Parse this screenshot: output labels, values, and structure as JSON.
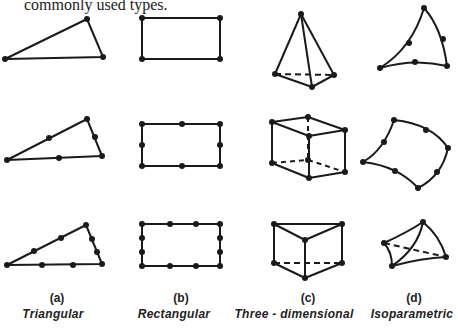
{
  "intro_text": "commonly used types.",
  "columns": [
    {
      "letter": "(a)",
      "name": "Triangular"
    },
    {
      "letter": "(b)",
      "name": "Rectangular"
    },
    {
      "letter": "(c)",
      "name": "Three - dimensional"
    },
    {
      "letter": "(d)",
      "name": "Isoparametric"
    }
  ],
  "colors": {
    "ink": "#1a1a1a",
    "background": "#ffffff"
  }
}
